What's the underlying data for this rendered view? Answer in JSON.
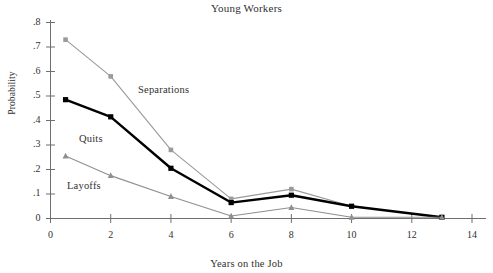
{
  "chart_data": {
    "type": "line",
    "title": "Young Workers",
    "xlabel": "Years on the Job",
    "ylabel": "Probability",
    "xlim": [
      0,
      14
    ],
    "ylim": [
      0,
      0.8
    ],
    "grid": false,
    "legend_position": "inline-annotations",
    "xticks": [
      "0",
      "2",
      "4",
      "6",
      "8",
      "10",
      "12",
      "14"
    ],
    "xtick_values": [
      0,
      2,
      4,
      6,
      8,
      10,
      12,
      14
    ],
    "yticks": [
      "0",
      ".1",
      ".2",
      ".3",
      ".4",
      ".5",
      ".6",
      ".7",
      ".8"
    ],
    "ytick_values": [
      0,
      0.1,
      0.2,
      0.3,
      0.4,
      0.5,
      0.6,
      0.7,
      0.8
    ],
    "x": [
      0.5,
      2,
      4,
      6,
      8,
      10,
      13
    ],
    "series": [
      {
        "name": "Separations",
        "marker": "square",
        "color": "#9a9a9a",
        "line_width": 1.1,
        "values": [
          0.73,
          0.58,
          0.28,
          0.08,
          0.12,
          0.05,
          0.005
        ]
      },
      {
        "name": "Quits",
        "marker": "square",
        "color": "#000000",
        "line_width": 2.4,
        "values": [
          0.485,
          0.415,
          0.205,
          0.065,
          0.095,
          0.05,
          0.005
        ]
      },
      {
        "name": "Layoffs",
        "marker": "triangle",
        "color": "#8f8f8f",
        "line_width": 1.1,
        "values": [
          0.255,
          0.175,
          0.09,
          0.01,
          0.045,
          0.005,
          0.005
        ]
      }
    ],
    "annotations": [
      {
        "text": "Separations",
        "x_px": 138,
        "y_px": 84
      },
      {
        "text": "Quits",
        "x_px": 79,
        "y_px": 133
      },
      {
        "text": "Layoffs",
        "x_px": 67,
        "y_px": 180
      }
    ]
  }
}
